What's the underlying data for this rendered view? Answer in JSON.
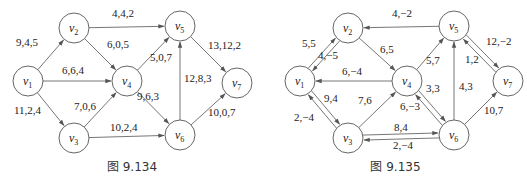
{
  "figures": [
    {
      "id": "left",
      "caption": "图 9.134",
      "nodes": [
        {
          "id": "v1",
          "base": "v",
          "sub": "1",
          "x": 28,
          "y": 81
        },
        {
          "id": "v2",
          "base": "v",
          "sub": "2",
          "x": 74,
          "y": 28
        },
        {
          "id": "v3",
          "base": "v",
          "sub": "3",
          "x": 74,
          "y": 138
        },
        {
          "id": "v4",
          "base": "v",
          "sub": "4",
          "x": 127,
          "y": 81
        },
        {
          "id": "v5",
          "base": "v",
          "sub": "5",
          "x": 180,
          "y": 26
        },
        {
          "id": "v6",
          "base": "v",
          "sub": "6",
          "x": 180,
          "y": 135
        },
        {
          "id": "v7",
          "base": "v",
          "sub": "7",
          "x": 237,
          "y": 83
        }
      ],
      "edges": [
        {
          "from": "v1",
          "to": "v2",
          "label": "9,4,5",
          "lx": 16,
          "ly": 46
        },
        {
          "from": "v1",
          "to": "v4",
          "label": "6,6,4",
          "lx": 62,
          "ly": 74
        },
        {
          "from": "v1",
          "to": "v3",
          "label": "11,2,4",
          "lx": 14,
          "ly": 114
        },
        {
          "from": "v2",
          "to": "v5",
          "label": "4,4,2",
          "lx": 112,
          "ly": 17
        },
        {
          "from": "v2",
          "to": "v4",
          "label": "6,0,5",
          "lx": 107,
          "ly": 48
        },
        {
          "from": "v3",
          "to": "v4",
          "label": "7,0,6",
          "lx": 74,
          "ly": 110
        },
        {
          "from": "v3",
          "to": "v6",
          "label": "10,2,4",
          "lx": 110,
          "ly": 131
        },
        {
          "from": "v4",
          "to": "v5",
          "label": "5,0,7",
          "lx": 150,
          "ly": 61
        },
        {
          "from": "v4",
          "to": "v6",
          "label": "9,6,3",
          "lx": 137,
          "ly": 100
        },
        {
          "from": "v6",
          "to": "v5",
          "label": "12,8,3",
          "lx": 184,
          "ly": 82
        },
        {
          "from": "v5",
          "to": "v7",
          "label": "13,12,2",
          "lx": 208,
          "ly": 49
        },
        {
          "from": "v6",
          "to": "v7",
          "label": "10,0,7",
          "lx": 208,
          "ly": 116
        }
      ]
    },
    {
      "id": "right",
      "caption": "图 9.135",
      "nodes": [
        {
          "id": "v1",
          "base": "v",
          "sub": "1",
          "x": 36,
          "y": 81
        },
        {
          "id": "v2",
          "base": "v",
          "sub": "2",
          "x": 84,
          "y": 28
        },
        {
          "id": "v3",
          "base": "v",
          "sub": "3",
          "x": 84,
          "y": 138
        },
        {
          "id": "v4",
          "base": "v",
          "sub": "4",
          "x": 143,
          "y": 81
        },
        {
          "id": "v5",
          "base": "v",
          "sub": "5",
          "x": 190,
          "y": 26
        },
        {
          "id": "v6",
          "base": "v",
          "sub": "6",
          "x": 190,
          "y": 135
        },
        {
          "id": "v7",
          "base": "v",
          "sub": "7",
          "x": 244,
          "y": 81
        }
      ],
      "edges": [
        {
          "from": "v1",
          "to": "v2",
          "label": "5,5",
          "lx": 38,
          "ly": 47,
          "offset": -2.5
        },
        {
          "from": "v2",
          "to": "v1",
          "label": "4,-5",
          "lx": 54,
          "ly": 59,
          "offset": -2.5
        },
        {
          "from": "v5",
          "to": "v2",
          "label": "4,-2",
          "lx": 128,
          "ly": 17
        },
        {
          "from": "v2",
          "to": "v4",
          "label": "6,5",
          "lx": 116,
          "ly": 53
        },
        {
          "from": "v4",
          "to": "v1",
          "label": "6,-4",
          "lx": 78,
          "ly": 75
        },
        {
          "from": "v1",
          "to": "v3",
          "label": "9,4",
          "lx": 60,
          "ly": 102,
          "offset": -2.5
        },
        {
          "from": "v3",
          "to": "v1",
          "label": "2,-4",
          "lx": 30,
          "ly": 121,
          "offset": -2.5
        },
        {
          "from": "v3",
          "to": "v4",
          "label": "7,6",
          "lx": 94,
          "ly": 104
        },
        {
          "from": "v4",
          "to": "v5",
          "label": "5,7",
          "lx": 162,
          "ly": 64
        },
        {
          "from": "v4",
          "to": "v6",
          "label": "3,3",
          "lx": 162,
          "ly": 92,
          "offset": -2.5
        },
        {
          "from": "v6",
          "to": "v4",
          "label": "6,-3",
          "lx": 136,
          "ly": 110,
          "offset": -2.5
        },
        {
          "from": "v3",
          "to": "v6",
          "label": "8,4",
          "lx": 130,
          "ly": 131,
          "offset": -2.5
        },
        {
          "from": "v6",
          "to": "v3",
          "label": "2,-4",
          "lx": 129,
          "ly": 149,
          "offset": -2.5
        },
        {
          "from": "v6",
          "to": "v5",
          "label": "4,3",
          "lx": 195,
          "ly": 90
        },
        {
          "from": "v5",
          "to": "v7",
          "label": "1,2",
          "lx": 201,
          "ly": 63,
          "offset": -2.5
        },
        {
          "from": "v7",
          "to": "v5",
          "label": "12,-2",
          "lx": 222,
          "ly": 45,
          "offset": -2.5
        },
        {
          "from": "v6",
          "to": "v7",
          "label": "10,7",
          "lx": 220,
          "ly": 114
        }
      ]
    }
  ]
}
